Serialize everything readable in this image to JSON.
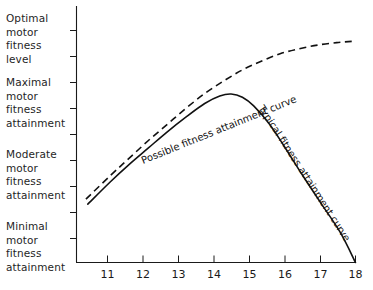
{
  "chart_data": {
    "type": "line",
    "title": "",
    "xlabel": "",
    "ylabel": "",
    "xlim": [
      10.6,
      18.0
    ],
    "ylim": [
      0,
      10
    ],
    "grid": false,
    "legend_position": "inline-on-curve",
    "x_ticks": [
      "11",
      "12",
      "13",
      "14",
      "15",
      "16",
      "17",
      "18"
    ],
    "y_tick_count": 10,
    "y_category_labels": [
      "Optimal\nmotor\nfitness\nlevel",
      "Maximal\nmotor\nfitness\nattainment",
      "Moderate\nmotor\nfitness\nattainment",
      "Minimal\nmotor\nfitness\nattainment"
    ],
    "series": [
      {
        "name": "Possible fitness attainment curve",
        "style": "dashed",
        "color": "#111111",
        "x": [
          10.85,
          11.5,
          12.0,
          12.5,
          13.0,
          13.5,
          14.0,
          14.5,
          15.0,
          15.5,
          16.0,
          16.5,
          17.0,
          17.5,
          17.9
        ],
        "y": [
          2.55,
          3.5,
          4.2,
          4.9,
          5.55,
          6.2,
          6.8,
          7.3,
          7.75,
          8.1,
          8.4,
          8.6,
          8.75,
          8.85,
          8.9
        ]
      },
      {
        "name": "Typical fitness attainment curve",
        "style": "solid",
        "color": "#111111",
        "x": [
          10.9,
          11.5,
          12.0,
          12.5,
          13.0,
          13.5,
          14.0,
          14.4,
          14.7,
          15.0,
          15.3,
          15.7,
          16.1,
          16.6,
          17.1,
          17.6,
          18.0
        ],
        "y": [
          2.35,
          3.25,
          3.95,
          4.6,
          5.25,
          5.85,
          6.4,
          6.7,
          6.78,
          6.65,
          6.3,
          5.6,
          4.7,
          3.5,
          2.35,
          1.2,
          0.0
        ]
      }
    ],
    "annotations": [
      {
        "text": "Possible fitness attainment curve",
        "attached_to": "Possible fitness attainment curve",
        "rotation_deg": -22
      },
      {
        "text": "Typical fitness attainment curve",
        "attached_to": "Typical fitness attainment curve",
        "rotation_deg": 57
      }
    ]
  },
  "axes": {
    "y_labels": [
      {
        "id": "optimal",
        "text": "Optimal\nmotor\nfitness\nlevel"
      },
      {
        "id": "maximal",
        "text": "Maximal\nmotor\nfitness\nattainment"
      },
      {
        "id": "moderate",
        "text": "Moderate\nmotor\nfitness\nattainment"
      },
      {
        "id": "minimal",
        "text": "Minimal\nmotor\nfitness\nattainment"
      }
    ],
    "x_ticks": [
      {
        "value": "11"
      },
      {
        "value": "12"
      },
      {
        "value": "13"
      },
      {
        "value": "14"
      },
      {
        "value": "15"
      },
      {
        "value": "16"
      },
      {
        "value": "17"
      },
      {
        "value": "18"
      }
    ]
  },
  "curves": {
    "possible_label": "Possible fitness attainment curve",
    "typical_label": "Typical fitness attainment curve"
  },
  "colors": {
    "ink": "#111111",
    "axis": "#1a1a1a",
    "background": "#ffffff"
  }
}
